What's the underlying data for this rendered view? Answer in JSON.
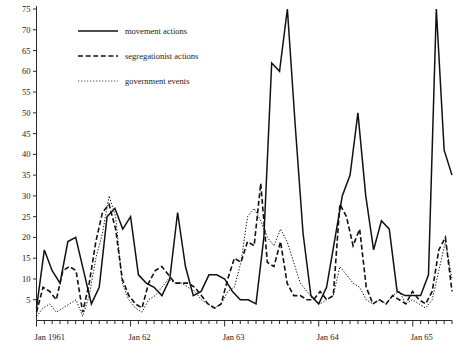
{
  "chart_data": {
    "type": "line",
    "title": "",
    "subtitle": "",
    "xlabel": "",
    "ylabel": "",
    "ylim": [
      0,
      77
    ],
    "yticks": [
      5,
      10,
      15,
      20,
      25,
      30,
      35,
      40,
      45,
      50,
      55,
      60,
      65,
      70,
      75
    ],
    "ytick_labels": [
      "5",
      "10",
      "15",
      "20",
      "25",
      "30",
      "35",
      "40",
      "45",
      "50",
      "55",
      "60",
      "65",
      "70",
      "75"
    ],
    "xlim": [
      0,
      53
    ],
    "xticks": [
      0,
      12,
      24,
      36,
      48
    ],
    "xtick_labels": [
      "Jan 1961",
      "Jan 62",
      "Jan 63",
      "Jan 64",
      "Jan 65"
    ],
    "minor_xticks_per_year": 12,
    "grid": false,
    "legend_position": "top-left",
    "series": [
      {
        "name": "movement actions",
        "style": "solid",
        "color": "#111111",
        "values": [
          3,
          17,
          12,
          9,
          19,
          20,
          12,
          4,
          8,
          25,
          27,
          22,
          25,
          11,
          9,
          8,
          6,
          10,
          26,
          13,
          6,
          7,
          11,
          11,
          10,
          7,
          5,
          5,
          4,
          20,
          62,
          60,
          75,
          47,
          21,
          6,
          4,
          8,
          19,
          30,
          35,
          50,
          30,
          17,
          24,
          22,
          7,
          6,
          6,
          6,
          11,
          75,
          41,
          35
        ]
      },
      {
        "name": "segregationist actions",
        "style": "dashed",
        "color": "#111111",
        "values": [
          2,
          8,
          7,
          5,
          12,
          13,
          12,
          2,
          9,
          19,
          26,
          28,
          22,
          10,
          6,
          4,
          3,
          9,
          12,
          13,
          11,
          9,
          9,
          9,
          8,
          6,
          4,
          3,
          4,
          10,
          15,
          14,
          19,
          18,
          33,
          14,
          13,
          19,
          9,
          6,
          6,
          5,
          5,
          7,
          5,
          6,
          28,
          25,
          18,
          22,
          8,
          4,
          5,
          4,
          6,
          5,
          4,
          7,
          5,
          4,
          7,
          17,
          20,
          7
        ]
      },
      {
        "name": "government events",
        "style": "dotted",
        "color": "#555555",
        "values": [
          1,
          3,
          4,
          2,
          3,
          4,
          5,
          1,
          6,
          15,
          21,
          30,
          25,
          9,
          5,
          3,
          2,
          5,
          6,
          8,
          10,
          9,
          9,
          8,
          7,
          5,
          4,
          3,
          4,
          7,
          8,
          14,
          25,
          27,
          24,
          20,
          18,
          22,
          19,
          14,
          9,
          7,
          5,
          4,
          5,
          6,
          13,
          11,
          9,
          8,
          5,
          4,
          5,
          4,
          6,
          7,
          4,
          5,
          4,
          3,
          5,
          12,
          19,
          10
        ]
      }
    ]
  },
  "legend": {
    "items": [
      {
        "label": "movement actions",
        "style": "solid"
      },
      {
        "label": "segregationist actions",
        "style": "dashed"
      },
      {
        "label": "government events",
        "style": "dotted"
      }
    ]
  },
  "axes": {
    "y_axis_name": "count-axis",
    "x_axis_name": "time-axis"
  }
}
